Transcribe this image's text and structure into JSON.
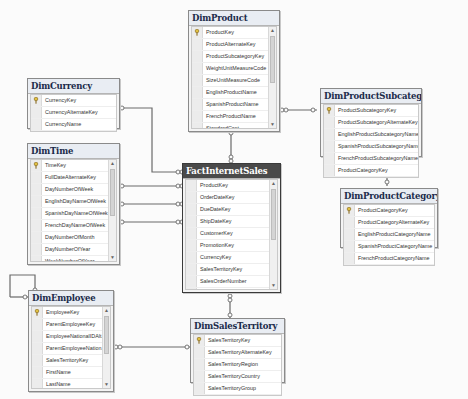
{
  "diagram": {
    "tables": {
      "DimProduct": {
        "title": "DimProduct",
        "columns": [
          "ProductKey",
          "ProductAlternateKey",
          "ProductSubcategoryKey",
          "WeightUnitMeasureCode",
          "SizeUnitMeasureCode",
          "EnglishProductName",
          "SpanishProductName",
          "FrenchProductName",
          "StandardCost",
          "FinishedGoodsFlag",
          "Color"
        ],
        "primary_key": "ProductKey",
        "scrollable": true
      },
      "DimCurrency": {
        "title": "DimCurrency",
        "columns": [
          "CurrencyKey",
          "CurrencyAlternateKey",
          "CurrencyName"
        ],
        "primary_key": "CurrencyKey",
        "scrollable": false
      },
      "DimTime": {
        "title": "DimTime",
        "columns": [
          "TimeKey",
          "FullDateAlternateKey",
          "DayNumberOfWeek",
          "EnglishDayNameOfWeek",
          "SpanishDayNameOfWeek",
          "FrenchDayNameOfWeek",
          "DayNumberOfMonth",
          "DayNumberOfYear",
          "WeekNumberOfYear",
          "EnglishMonthName",
          "SpanishMonthName"
        ],
        "primary_key": "TimeKey",
        "scrollable": true
      },
      "FactInternetSales": {
        "title": "FactInternetSales",
        "columns": [
          "ProductKey",
          "OrderDateKey",
          "DueDateKey",
          "ShipDateKey",
          "CustomerKey",
          "PromotionKey",
          "CurrencyKey",
          "SalesTerritoryKey",
          "SalesOrderNumber",
          "SalesOrderLineNumber",
          "RevisionNumber",
          "OrderQuantity",
          "UnitPrice"
        ],
        "primary_key": null,
        "scrollable": true,
        "selected": true
      },
      "DimProductSubcategory": {
        "title": "DimProductSubcategory",
        "columns": [
          "ProductSubcategoryKey",
          "ProductSubcategoryAlternateKey",
          "EnglishProductSubcategoryName",
          "SpanishProductSubcategoryName",
          "FrenchProductSubcategoryName",
          "ProductCategoryKey"
        ],
        "primary_key": "ProductSubcategoryKey",
        "scrollable": false
      },
      "DimProductCategory": {
        "title": "DimProductCategory",
        "columns": [
          "ProductCategoryKey",
          "ProductCategoryAlternateKey",
          "EnglishProductCategoryName",
          "SpanishProductCategoryName",
          "FrenchProductCategoryName"
        ],
        "primary_key": "ProductCategoryKey",
        "scrollable": false
      },
      "DimEmployee": {
        "title": "DimEmployee",
        "columns": [
          "EmployeeKey",
          "ParentEmployeeKey",
          "EmployeeNationalIDAlt...",
          "ParentEmployeeNation...",
          "SalesTerritoryKey",
          "FirstName",
          "LastName",
          "MiddleName",
          "NameStyle"
        ],
        "primary_key": "EmployeeKey",
        "scrollable": true
      },
      "DimSalesTerritory": {
        "title": "DimSalesTerritory",
        "columns": [
          "SalesTerritoryKey",
          "SalesTerritoryAlternateKey",
          "SalesTerritoryRegion",
          "SalesTerritoryCountry",
          "SalesTerritoryGroup"
        ],
        "primary_key": "SalesTerritoryKey",
        "scrollable": false
      }
    },
    "relationships": [
      {
        "from": "FactInternetSales",
        "to": "DimProduct"
      },
      {
        "from": "FactInternetSales",
        "to": "DimCurrency"
      },
      {
        "from": "FactInternetSales",
        "to": "DimTime",
        "note": "OrderDateKey"
      },
      {
        "from": "FactInternetSales",
        "to": "DimTime",
        "note": "DueDateKey"
      },
      {
        "from": "FactInternetSales",
        "to": "DimTime",
        "note": "ShipDateKey"
      },
      {
        "from": "FactInternetSales",
        "to": "DimSalesTerritory"
      },
      {
        "from": "DimProduct",
        "to": "DimProductSubcategory"
      },
      {
        "from": "DimProductSubcategory",
        "to": "DimProductCategory"
      },
      {
        "from": "DimEmployee",
        "to": "DimSalesTerritory"
      },
      {
        "from": "DimEmployee",
        "to": "DimEmployee",
        "note": "self-reference"
      }
    ],
    "colors": {
      "canvas": "#fbfbfb",
      "fact_header": "#4a4a4a",
      "dim_header": "#e9edf3",
      "connector": "#6a6a6a"
    }
  }
}
